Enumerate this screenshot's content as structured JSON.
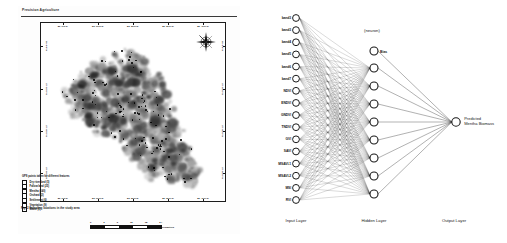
{
  "page": {
    "running_head": "Precision Agriculture",
    "figure_caption": "Fig. 2  Sampling locations in the study area"
  },
  "map": {
    "x_ticks": [
      "80°0'0\"E",
      "80°10'0\"E",
      "80°20'0\"E",
      "80°30'0\"E",
      "80°40'0\"E"
    ],
    "y_ticks": [
      "28°0'0\"N",
      "27°50'0\"N",
      "27°40'0\"N",
      "27°30'0\"N"
    ],
    "compass_icon": "compass-rose-icon",
    "legend": {
      "title": "GPS points taken for different features",
      "items": [
        {
          "label": "Dry river bed (5)",
          "color": "#111111"
        },
        {
          "label": "Fallow land (25)",
          "color": "#111111"
        },
        {
          "label": "Mentha (140)",
          "color": "#111111"
        },
        {
          "label": "Orchard (2)",
          "color": "#111111"
        },
        {
          "label": "Settlement (6)",
          "color": "#111111"
        },
        {
          "label": "Vegetation (9)",
          "color": "#111111"
        },
        {
          "label": "Water (6)",
          "color": "#111111"
        }
      ]
    },
    "scale": {
      "ticks": [
        "0",
        "3",
        "6",
        "12",
        "18",
        "24"
      ],
      "unit": "Kilometers"
    }
  },
  "ann": {
    "neuron_note": "(neuron)",
    "bias_label": "Bias",
    "output_label_line1": "Predicted",
    "output_label_line2": "Mentha Biomass",
    "layers": [
      {
        "name": "Input Layer"
      },
      {
        "name": "Hidden Layer"
      },
      {
        "name": "Output Layer"
      }
    ],
    "input_nodes": [
      "band3",
      "band3",
      "band4",
      "band5",
      "band6",
      "band7",
      "NDVI",
      "ENDVI",
      "GNDVI",
      "TNDVI",
      "GVI",
      "SAVI",
      "MSAVI-1",
      "MSAVI-2",
      "MSI",
      "RVI"
    ],
    "hidden_node_count": 8,
    "output_node_count": 1,
    "colors": {
      "stroke": "#1a1a1a",
      "node_fill": "#ffffff"
    }
  }
}
